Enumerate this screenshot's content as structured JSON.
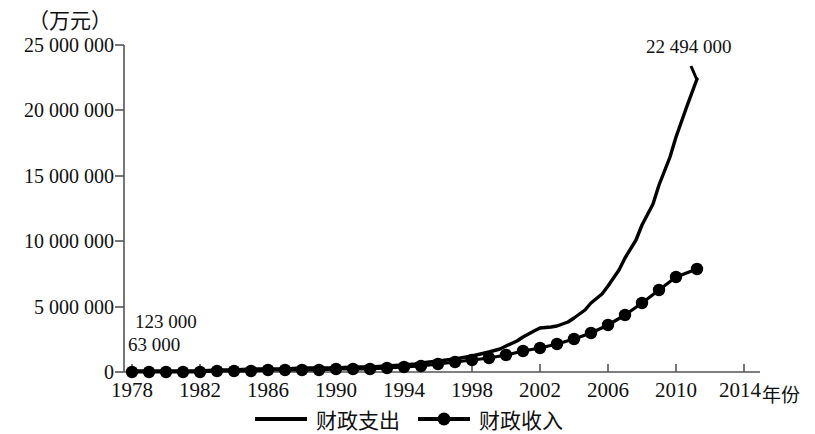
{
  "chart_data": {
    "type": "line",
    "title": "",
    "ylabel": "（万元）",
    "xlabel": "年份",
    "ylim": [
      0,
      25000000
    ],
    "xlim": [
      1978,
      2014
    ],
    "grid": false,
    "legend_position": "bottom",
    "yticks": [
      0,
      5000000,
      10000000,
      15000000,
      20000000,
      25000000
    ],
    "ytick_labels": [
      "0",
      "5 000 000",
      "10 000 000",
      "15 000 000",
      "20 000 000",
      "25 000 000"
    ],
    "xticks": [
      1978,
      1982,
      1986,
      1990,
      1994,
      1998,
      2002,
      2006,
      2010,
      2014
    ],
    "xtick_labels": [
      "1978",
      "1982",
      "1986",
      "1990",
      "1994",
      "1998",
      "2002",
      "2006",
      "2010",
      "2014"
    ],
    "x": [
      1978,
      1979,
      1980,
      1981,
      1982,
      1983,
      1984,
      1985,
      1986,
      1987,
      1988,
      1989,
      1990,
      1991,
      1992,
      1993,
      1994,
      1995,
      1996,
      1997,
      1998,
      1999,
      2000,
      2001,
      2002,
      2003,
      2004,
      2005,
      2006,
      2007,
      2008,
      2009,
      2010,
      2011
    ],
    "series": [
      {
        "name": "财政支出",
        "marker": "none",
        "color": "#000000",
        "values": [
          112200,
          128200,
          122800,
          113800,
          115300,
          129800,
          154600,
          184400,
          233000,
          226200,
          249100,
          282300,
          308400,
          338700,
          374200,
          464200,
          579280,
          682370,
          793755,
          923356,
          1079818,
          1318767,
          1588650,
          1880423,
          2205315,
          2464999,
          2848689,
          3393028,
          4042273,
          4978135,
          6259266,
          7629999,
          8987415,
          22494000
        ]
      },
      {
        "name": "财政收入",
        "marker": "circle",
        "color": "#000000",
        "values": [
          113200,
          114600,
          115900,
          117600,
          121200,
          136700,
          164200,
          200500,
          212200,
          219900,
          235700,
          266400,
          293700,
          314900,
          348300,
          434900,
          521810,
          624220,
          740800,
          865100,
          987600,
          1144400,
          1339500,
          1638600,
          1890360,
          2171530,
          2639650,
          3164650,
          3876020,
          5132170,
          6133040,
          6851830,
          8310151,
          9000000
        ]
      }
    ],
    "annotations": [
      {
        "id": "annot-peak",
        "text": "22 494 000",
        "x": 2011,
        "y": 22494000
      },
      {
        "id": "annot-a",
        "text": "123 000",
        "x": 1979,
        "y": 1600000
      },
      {
        "id": "annot-b",
        "text": "63 000",
        "x": 1978,
        "y": 1050000
      }
    ],
    "legend": [
      {
        "label": "财政支出",
        "marker": "none"
      },
      {
        "label": "财政收入",
        "marker": "circle"
      }
    ]
  },
  "pixel_geometry": {
    "plot_left": 124,
    "plot_right": 760,
    "plot_bottom": 372,
    "plot_top": 45,
    "x_px_per_year": 17.0,
    "x_origin_px": 124
  },
  "expenditure_path_px": "M132,371 L149,371 L166,371 L183,371 L200,371 L217,370 L234,370 L251,369 L268,369 L285,369 L302,368 L319,368 L336,368 L353,367 L370,367 L387,366 L404,365 L415,364 L421,363 L438,361 L455,359 L472,356 L489,352 L500,349 L506,346 L517,341 L523,337 L534,331 L540,328 L551,327 L557,326 L568,322 L574,318 L585,310 L591,303 L602,294 L608,286 L619,270 L625,258 L636,240 L642,225 L653,204 L659,185 L670,157 L676,137 L687,106 L697,79",
  "revenue_path_px": "M132,372 L149,372 L166,372 L183,372 L200,372 L217,371 L234,371 L251,371 L268,370 L285,370 L302,370 L319,370 L336,369 L353,369 L370,369 L387,368 L404,367 L421,366 L438,364 L455,362 L472,360 L489,358 L506,355 L523,351 L540,348 L557,344 L574,339 L591,333 L608,325 L625,315 L642,303 L659,290 L676,277 L697,269",
  "revenue_markers_px": [
    [
      132,
      372
    ],
    [
      149,
      372
    ],
    [
      166,
      372
    ],
    [
      183,
      372
    ],
    [
      200,
      372
    ],
    [
      217,
      371
    ],
    [
      234,
      371
    ],
    [
      251,
      371
    ],
    [
      268,
      370
    ],
    [
      285,
      370
    ],
    [
      302,
      370
    ],
    [
      319,
      370
    ],
    [
      336,
      369
    ],
    [
      353,
      369
    ],
    [
      370,
      369
    ],
    [
      387,
      368
    ],
    [
      404,
      367
    ],
    [
      421,
      366
    ],
    [
      438,
      364
    ],
    [
      455,
      362
    ],
    [
      472,
      360
    ],
    [
      489,
      358
    ],
    [
      506,
      355
    ],
    [
      523,
      351
    ],
    [
      540,
      348
    ],
    [
      557,
      344
    ],
    [
      574,
      339
    ],
    [
      591,
      333
    ],
    [
      608,
      325
    ],
    [
      625,
      315
    ],
    [
      642,
      303
    ],
    [
      659,
      290
    ],
    [
      676,
      277
    ],
    [
      697,
      269
    ]
  ],
  "ytick_px": [
    372,
    307,
    241,
    176,
    110,
    45
  ],
  "xtick_px": [
    132,
    200,
    268,
    336,
    404,
    472,
    540,
    608,
    676,
    744
  ]
}
